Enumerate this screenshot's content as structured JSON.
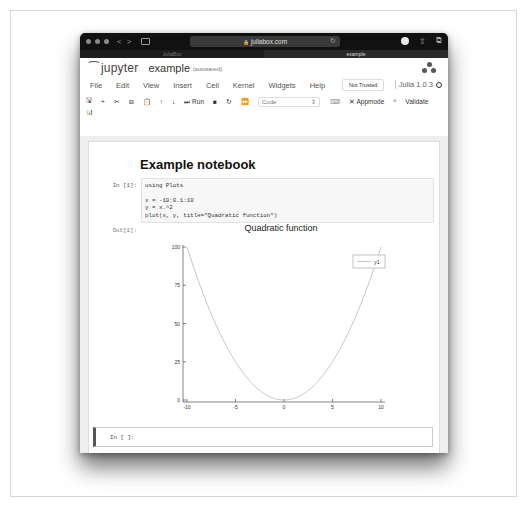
{
  "browser": {
    "url": "juliabox.com",
    "tabs": [
      {
        "label": "JuliaBox",
        "active": false
      },
      {
        "label": "example",
        "active": true
      }
    ],
    "icons": [
      "close-dot",
      "minimize-dot",
      "zoom-dot",
      "back-arrow",
      "forward-arrow",
      "sidebar-icon",
      "lock-icon",
      "reload-icon",
      "download-icon",
      "share-icon",
      "tabs-icon"
    ]
  },
  "header": {
    "brand": "jupyter",
    "notebook_name": "example",
    "save_status": "(autosaved)"
  },
  "menu": {
    "items": [
      "File",
      "Edit",
      "View",
      "Insert",
      "Cell",
      "Kernel",
      "Widgets",
      "Help"
    ],
    "trust_label": "Not Trusted",
    "kernel_name": "Julia 1.0.3"
  },
  "toolbar": {
    "buttons": [
      {
        "icon": "save-icon",
        "glyph": "🖫"
      },
      {
        "icon": "plus-icon",
        "glyph": "+"
      },
      {
        "icon": "cut-icon",
        "glyph": "✂"
      },
      {
        "icon": "copy-icon",
        "glyph": "⧉"
      },
      {
        "icon": "paste-icon",
        "glyph": "📋"
      },
      {
        "icon": "arrow-up-icon",
        "glyph": "↑"
      },
      {
        "icon": "arrow-down-icon",
        "glyph": "↓"
      }
    ],
    "run_label": "Run",
    "run_glyph": "⏭",
    "stop_glyph": "■",
    "restart_glyph": "↻",
    "fastforward_glyph": "⏩",
    "cell_type": "Code",
    "keyboard_glyph": "⌨",
    "appmode_label": "Appmode",
    "appmode_glyph": "✕",
    "caret_glyph": "^",
    "validate_label": "Validate",
    "chart_glyph": "📊"
  },
  "notebook": {
    "title": "Example notebook",
    "cells": [
      {
        "prompt": "In [1]:",
        "code": "using Plots\n\nx = -10:0.1:10\ny = x.^2\nplot(x, y, title=\"Quadratic function\")"
      }
    ],
    "output_prompt": "Out[1]:",
    "empty_prompt": "In [ ]:"
  },
  "chart_data": {
    "type": "line",
    "title": "Quadratic function",
    "xlabel": "",
    "ylabel": "",
    "xlim": [
      -10,
      10
    ],
    "ylim": [
      0,
      100
    ],
    "x_ticks": [
      "-10",
      "-5",
      "0",
      "5",
      "10"
    ],
    "y_ticks": [
      "0",
      "25",
      "50",
      "75",
      "100"
    ],
    "grid": false,
    "legend_position": "top-right",
    "series": [
      {
        "name": "y1",
        "x": [
          -10,
          -8,
          -6,
          -4,
          -2,
          0,
          2,
          4,
          6,
          8,
          10
        ],
        "values": [
          100,
          64,
          36,
          16,
          4,
          0,
          4,
          16,
          36,
          64,
          100
        ]
      }
    ]
  }
}
